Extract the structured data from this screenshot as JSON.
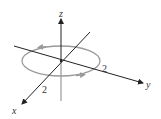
{
  "diagram": {
    "type": "3d-axes-with-oriented-circle",
    "axes": {
      "x_label": "x",
      "y_label": "y",
      "z_label": "z"
    },
    "circle": {
      "plane": "xy",
      "radius_label_x": "2",
      "radius_label_y": "2",
      "orientation": "counterclockwise (viewed from above)",
      "color": "#9a9a9a"
    },
    "colors": {
      "axis": "#222222",
      "axis_hidden": "#9a9a9a",
      "circle": "#9a9a9a",
      "text": "#333333"
    }
  }
}
